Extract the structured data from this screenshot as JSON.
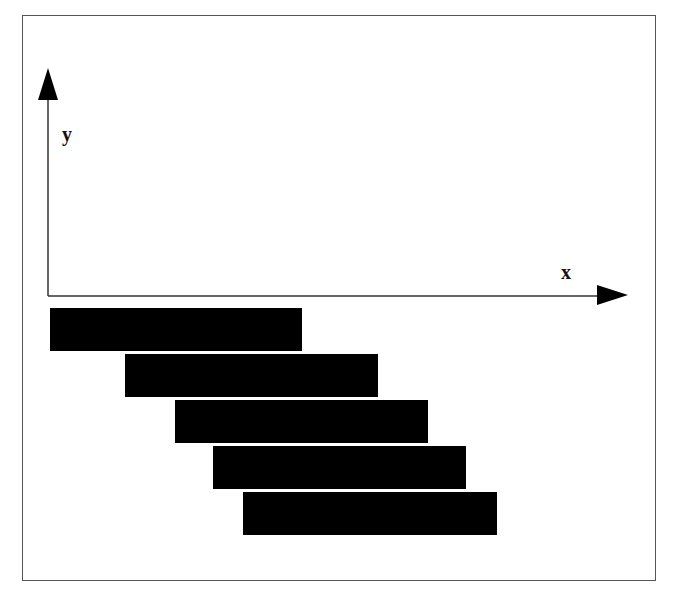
{
  "diagram": {
    "type": "staircase-bars-on-axes",
    "axes": {
      "x_label": "x",
      "y_label": "y",
      "color": "#333333",
      "origin": [
        48,
        296
      ],
      "x_axis_end": 628,
      "y_axis_top": 68
    },
    "bar_color": "#000000",
    "bars": [
      {
        "id": 1,
        "left": 50,
        "top": 308,
        "width": 252,
        "height": 43
      },
      {
        "id": 2,
        "left": 125,
        "top": 354,
        "width": 253,
        "height": 43
      },
      {
        "id": 3,
        "left": 175,
        "top": 400,
        "width": 253,
        "height": 43
      },
      {
        "id": 4,
        "left": 213,
        "top": 446,
        "width": 253,
        "height": 43
      },
      {
        "id": 5,
        "left": 243,
        "top": 492,
        "width": 254,
        "height": 43
      }
    ]
  }
}
